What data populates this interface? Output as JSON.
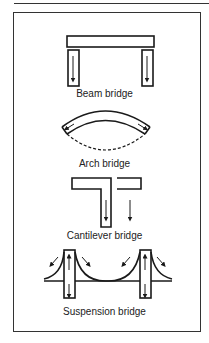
{
  "diagram": {
    "labels": {
      "beam": "Beam bridge",
      "arch": "Arch bridge",
      "cantilever": "Cantilever bridge",
      "suspension": "Suspension bridge"
    },
    "colors": {
      "ink": "#1a1a1a",
      "background": "#ffffff"
    }
  }
}
